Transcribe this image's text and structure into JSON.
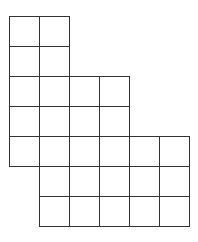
{
  "diagram": {
    "type": "grid-polyomino",
    "origin": [
      9,
      16
    ],
    "cell_size": 30,
    "line_color": "#333333",
    "rows": [
      {
        "row": 0,
        "cols": [
          0,
          1
        ]
      },
      {
        "row": 1,
        "cols": [
          0,
          1
        ]
      },
      {
        "row": 2,
        "cols": [
          0,
          1,
          2,
          3
        ]
      },
      {
        "row": 3,
        "cols": [
          0,
          1,
          2,
          3
        ]
      },
      {
        "row": 4,
        "cols": [
          0,
          1,
          2,
          3,
          4,
          5
        ]
      },
      {
        "row": 5,
        "cols": [
          1,
          2,
          3,
          4,
          5
        ]
      },
      {
        "row": 6,
        "cols": [
          1,
          2,
          3,
          4,
          5
        ]
      }
    ],
    "total_cells": 26
  }
}
